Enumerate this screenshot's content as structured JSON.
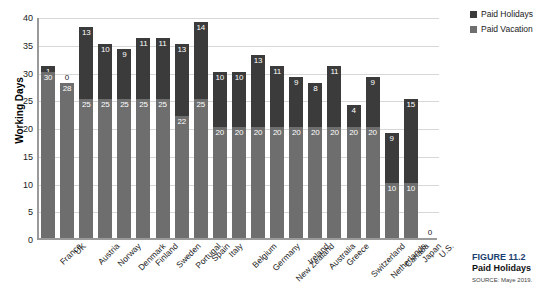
{
  "chart_data": {
    "type": "bar",
    "stacked": true,
    "title": "",
    "xlabel": "",
    "ylabel": "Working Days",
    "ylim": [
      0,
      40
    ],
    "yticks": [
      0,
      5,
      10,
      15,
      20,
      25,
      30,
      35,
      40
    ],
    "grid": true,
    "legend_position": "top-right",
    "categories": [
      "France",
      "UK",
      "Austria",
      "Norway",
      "Denmark",
      "Finland",
      "Sweden",
      "Portugal",
      "Spain",
      "Italy",
      "Belgium",
      "Germany",
      "New Zealand",
      "Ireland",
      "Australia",
      "Greece",
      "Switzerland",
      "Netherlands",
      "Canada",
      "Japan",
      "U.S."
    ],
    "series": [
      {
        "name": "Paid Holidays",
        "color": "#3b3b3b",
        "values": [
          1,
          0,
          13,
          10,
          9,
          11,
          11,
          13,
          14,
          10,
          10,
          13,
          11,
          9,
          8,
          11,
          4,
          9,
          9,
          15,
          0
        ]
      },
      {
        "name": "Paid Vacation",
        "color": "#6e6e6e",
        "values": [
          30,
          28,
          25,
          25,
          25,
          25,
          25,
          22,
          25,
          20,
          20,
          20,
          20,
          20,
          20,
          20,
          20,
          20,
          10,
          10,
          0
        ]
      }
    ],
    "totals": [
      31,
      28,
      38,
      35,
      34,
      36,
      36,
      35,
      39,
      30,
      30,
      33,
      31,
      29,
      28,
      31,
      24,
      29,
      19,
      25,
      0
    ]
  },
  "legend": {
    "items": [
      {
        "label": "Paid Holidays",
        "color": "#3b3b3b"
      },
      {
        "label": "Paid Vacation",
        "color": "#6e6e6e"
      }
    ]
  },
  "caption": {
    "figure_label": "FIGURE 11.2",
    "title_line": "Paid Holidays",
    "source": "SOURCE: Maye 2019."
  },
  "axis": {
    "y_title": "Working Days"
  }
}
